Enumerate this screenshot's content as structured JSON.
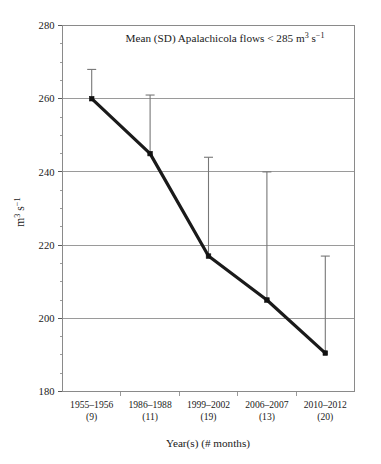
{
  "chart_data": {
    "type": "line",
    "title_parts": {
      "lead": "Mean (SD) Apalachicola flows < 285 m",
      "exp1": "3",
      "mid": " s",
      "exp2": "−1"
    },
    "xlabel": "Year(s) (# months)",
    "ylabel": "m³ s⁻¹",
    "ylabel_parts": {
      "lead": "m",
      "exp1": "3",
      "mid": " s",
      "exp2": "−1"
    },
    "categories": [
      "1955–1956",
      "1986–1988",
      "1999–2002",
      "2006–2007",
      "2010–2012"
    ],
    "category_counts": [
      "(9)",
      "(11)",
      "(19)",
      "(13)",
      "(20)"
    ],
    "xtick_labels": [
      {
        "years": "1955–1956",
        "months": "(9)"
      },
      {
        "years": "1986–1988",
        "months": "(11)"
      },
      {
        "years": "1999–2002",
        "months": "(19)"
      },
      {
        "years": "2006–2007",
        "months": "(13)"
      },
      {
        "years": "2010–2012",
        "months": "(20)"
      }
    ],
    "values": [
      260,
      245,
      217,
      205,
      190.5
    ],
    "error_upper": [
      268,
      261,
      244,
      240,
      217
    ],
    "sd": [
      8,
      16,
      27,
      35,
      26.5
    ],
    "ylim": [
      180,
      280
    ],
    "yticks": [
      180,
      200,
      220,
      240,
      260,
      280
    ],
    "ytick_labels": [
      "180",
      "200",
      "220",
      "240",
      "260",
      "280"
    ],
    "y_minor_step": 5,
    "grid": true,
    "legend": false,
    "error_bar_direction": "up-only",
    "marker": "filled-square",
    "line_color": "#111111",
    "error_color": "#777777",
    "grid_color": "#9a9a9a"
  }
}
